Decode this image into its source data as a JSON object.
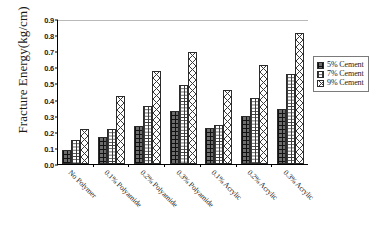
{
  "chart_data": {
    "type": "bar",
    "title": "",
    "xlabel": "",
    "ylabel": "Fracture Energy(kg/cm)",
    "ylim": [
      0.0,
      0.9
    ],
    "yticks": [
      "0.0",
      "0.1",
      "0.2",
      "0.3",
      "0.4",
      "0.5",
      "0.6",
      "0.7",
      "0.8",
      "0.9"
    ],
    "grid": false,
    "legend_position": "right-outside",
    "categories": [
      "No Polymer",
      "0.1% Polyamide",
      "0.2% Polyamide",
      "0.3% Polyamide",
      "0.1% Acrylic",
      "0.2% Acrylic",
      "0.3% Acrylic"
    ],
    "series": [
      {
        "name": "5% Cement",
        "pattern": "dotted-checker",
        "values": [
          0.09,
          0.17,
          0.235,
          0.33,
          0.225,
          0.3,
          0.34
        ]
      },
      {
        "name": "7% Cement",
        "pattern": "horizontal-brick",
        "values": [
          0.15,
          0.22,
          0.36,
          0.49,
          0.245,
          0.41,
          0.56
        ]
      },
      {
        "name": "9% Cement",
        "pattern": "diagonal-crosshatch",
        "values": [
          0.22,
          0.42,
          0.58,
          0.695,
          0.46,
          0.615,
          0.815
        ]
      }
    ]
  },
  "legend": {
    "items": [
      {
        "label": "5% Cement"
      },
      {
        "label": "7% Cement"
      },
      {
        "label": "9% Cement"
      }
    ]
  },
  "colors": {
    "axis": "#000000",
    "bar_outline": "#2b2b2b",
    "series_5_fill": "#6e6e6e",
    "series_7_fill": "#ffffff",
    "series_9_fill": "#ffffff",
    "legend_border": "#7a7a7a",
    "background": "#ffffff"
  }
}
